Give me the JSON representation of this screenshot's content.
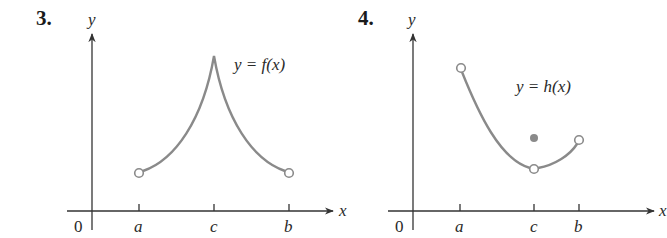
{
  "problems": [
    {
      "number": "3.",
      "y_label": "y",
      "x_label": "x",
      "origin_label": "0",
      "ticks": [
        "a",
        "c",
        "b"
      ],
      "equation": "y = f(x)",
      "description": "Cusp-shaped curve rising from an open circle at x=a to a sharp peak at x=c, then falling to an open circle at x=b."
    },
    {
      "number": "4.",
      "y_label": "y",
      "x_label": "x",
      "origin_label": "0",
      "ticks": [
        "a",
        "c",
        "b"
      ],
      "equation": "y = h(x)",
      "description": "Curve from an open circle at x=a decreasing to an open circle at x=c, then increasing to an open circle at x=b; a filled point sits above the curve at x=c."
    }
  ],
  "colors": {
    "curve": "#8a8a8a",
    "axis": "#333333",
    "filled_point": "#8a8a8a"
  }
}
